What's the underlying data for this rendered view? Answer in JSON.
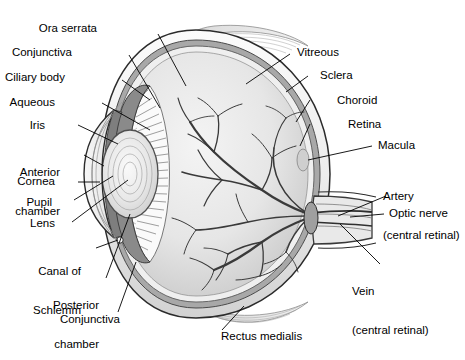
{
  "figure": {
    "style": "grayscale line drawing",
    "colors": {
      "ink": "#1a1a1a",
      "sclera": "#f2f2f2",
      "choroid": "#9a9a9a",
      "vitreous": "#e4e4e4",
      "iris": "#8a8a8a",
      "lens": "#ededed",
      "cornea": "#dcdcdc",
      "vessel": "#3a3a3a",
      "muscle": "#c9c9c9"
    }
  },
  "labels_left": [
    {
      "id": "ora-serrata",
      "text": "Ora serrata",
      "lines": [
        "Ora serrata"
      ]
    },
    {
      "id": "conjunctiva-top",
      "text": "Conjunctiva",
      "lines": [
        "Conjunctiva"
      ]
    },
    {
      "id": "ciliary-body",
      "text": "Ciliary body",
      "lines": [
        "Ciliary body"
      ]
    },
    {
      "id": "aqueous",
      "text": "Aqueous",
      "lines": [
        "Aqueous"
      ]
    },
    {
      "id": "iris",
      "text": "Iris",
      "lines": [
        "Iris"
      ]
    },
    {
      "id": "anterior-chamber",
      "text": "Anterior chamber",
      "lines": [
        "Anterior",
        "chamber"
      ]
    },
    {
      "id": "cornea",
      "text": "Cornea",
      "lines": [
        "Cornea"
      ]
    },
    {
      "id": "pupil",
      "text": "Pupil",
      "lines": [
        "Pupil"
      ]
    },
    {
      "id": "lens",
      "text": "Lens",
      "lines": [
        "Lens"
      ]
    },
    {
      "id": "canal-of-schlemm",
      "text": "Canal of Schlemm",
      "lines": [
        "Canal of",
        "Schlemm"
      ]
    },
    {
      "id": "posterior-chamber",
      "text": "Posterior chamber",
      "lines": [
        "Posterior",
        "chamber"
      ]
    },
    {
      "id": "conjunctiva-bottom",
      "text": "Conjunctiva",
      "lines": [
        "Conjunctiva"
      ]
    }
  ],
  "labels_right": [
    {
      "id": "vitreous",
      "text": "Vitreous",
      "lines": [
        "Vitreous"
      ]
    },
    {
      "id": "sclera",
      "text": "Sclera",
      "lines": [
        "Sclera"
      ]
    },
    {
      "id": "choroid",
      "text": "Choroid",
      "lines": [
        "Choroid"
      ]
    },
    {
      "id": "retina",
      "text": "Retina",
      "lines": [
        "Retina"
      ]
    },
    {
      "id": "macula",
      "text": "Macula",
      "lines": [
        "Macula"
      ]
    },
    {
      "id": "artery",
      "text": "Artery (central retinal)",
      "lines": [
        "Artery",
        "(central retinal)"
      ]
    },
    {
      "id": "optic-nerve",
      "text": "Optic nerve",
      "lines": [
        "Optic nerve"
      ]
    },
    {
      "id": "vein",
      "text": "Vein (central retinal)",
      "lines": [
        "Vein",
        "(central retinal)"
      ]
    }
  ],
  "labels_bottom": [
    {
      "id": "rectus-medialis",
      "text": "Rectus medialis",
      "lines": [
        "Rectus medialis"
      ]
    }
  ],
  "label_text": {
    "ora_serrata": "Ora serrata",
    "conjunctiva_top": "Conjunctiva",
    "ciliary_body": "Ciliary body",
    "aqueous": "Aqueous",
    "iris": "Iris",
    "anterior_1": "Anterior",
    "anterior_2": "chamber",
    "cornea": "Cornea",
    "pupil": "Pupil",
    "lens": "Lens",
    "canal_1": "Canal of",
    "canal_2": "Schlemm",
    "posterior_1": "Posterior",
    "posterior_2": "chamber",
    "conjunctiva_bottom": "Conjunctiva",
    "vitreous": "Vitreous",
    "sclera": "Sclera",
    "choroid": "Choroid",
    "retina": "Retina",
    "macula": "Macula",
    "artery_1": "Artery",
    "artery_2": "(central retinal)",
    "optic_nerve": "Optic nerve",
    "vein_1": "Vein",
    "vein_2": "(central retinal)",
    "rectus_medialis": "Rectus medialis"
  }
}
